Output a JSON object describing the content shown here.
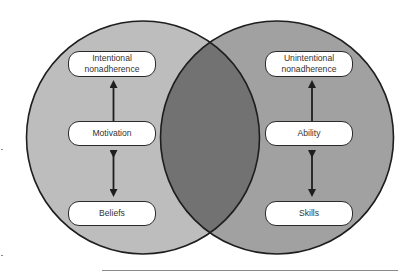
{
  "diagram": {
    "type": "venn",
    "left_circle": {
      "fill": "#b8b8b8",
      "nodes": {
        "top": {
          "line1": "Intentional",
          "line2": "nonadherence"
        },
        "middle": {
          "label": "Motivation"
        },
        "bottom": {
          "label": "Beliefs"
        }
      },
      "arrows": [
        {
          "from": "Motivation",
          "to": "Intentional nonadherence",
          "direction": "up"
        },
        {
          "from": "Motivation",
          "to": "Beliefs",
          "direction": "bidirectional"
        }
      ]
    },
    "right_circle": {
      "fill": "#9a9a9a",
      "nodes": {
        "top": {
          "line1": "Unintentional",
          "line2": "nonadherence"
        },
        "middle": {
          "label": "Ability"
        },
        "bottom": {
          "label": "Skills"
        }
      },
      "arrows": [
        {
          "from": "Ability",
          "to": "Unintentional nonadherence",
          "direction": "up"
        },
        {
          "from": "Ability",
          "to": "Skills",
          "direction": "bidirectional"
        }
      ]
    },
    "overlap_fill": "#6e6e6e",
    "stroke_color": "#1e1e1e"
  }
}
